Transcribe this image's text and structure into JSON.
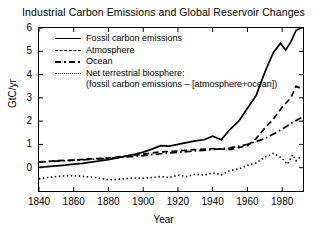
{
  "chart_data": {
    "type": "line",
    "title": "Industrial Carbon Emissions and Global Reservoir Changes",
    "xlabel": "Year",
    "ylabel": "GtC/yr",
    "xlim": [
      1840,
      1992
    ],
    "ylim": [
      -1.0,
      6.0
    ],
    "xticks": [
      1840,
      1860,
      1880,
      1900,
      1920,
      1940,
      1960,
      1980
    ],
    "yticks": [
      0,
      1,
      2,
      3,
      4,
      5,
      6
    ],
    "grid": false,
    "legend_position": "upper left",
    "series": [
      {
        "name": "Fossil carbon emissions",
        "style": "solid",
        "x": [
          1840,
          1845,
          1850,
          1855,
          1860,
          1865,
          1870,
          1875,
          1880,
          1885,
          1890,
          1895,
          1900,
          1905,
          1910,
          1915,
          1920,
          1925,
          1930,
          1935,
          1940,
          1945,
          1950,
          1955,
          1960,
          1965,
          1970,
          1975,
          1979,
          1982,
          1985,
          1988,
          1991
        ],
        "values": [
          0.02,
          0.05,
          0.08,
          0.11,
          0.15,
          0.19,
          0.24,
          0.29,
          0.35,
          0.42,
          0.5,
          0.58,
          0.67,
          0.8,
          0.95,
          0.93,
          1.0,
          1.08,
          1.15,
          1.2,
          1.35,
          1.2,
          1.65,
          2.0,
          2.55,
          3.1,
          4.1,
          4.95,
          5.35,
          5.05,
          5.4,
          5.9,
          6.0
        ]
      },
      {
        "name": "Atmosphere",
        "style": "dashed",
        "x": [
          1840,
          1850,
          1860,
          1870,
          1880,
          1890,
          1900,
          1910,
          1920,
          1930,
          1940,
          1950,
          1960,
          1965,
          1970,
          1975,
          1980,
          1985,
          1988,
          1991
        ],
        "values": [
          0.25,
          0.3,
          0.33,
          0.38,
          0.42,
          0.5,
          0.58,
          0.68,
          0.72,
          0.78,
          0.82,
          0.78,
          0.95,
          1.25,
          1.7,
          2.1,
          2.6,
          3.0,
          3.5,
          3.4
        ]
      },
      {
        "name": "Ocean",
        "style": "dashdot",
        "x": [
          1840,
          1850,
          1860,
          1870,
          1880,
          1890,
          1900,
          1910,
          1920,
          1930,
          1940,
          1950,
          1960,
          1970,
          1980,
          1985,
          1991
        ],
        "values": [
          0.24,
          0.28,
          0.32,
          0.36,
          0.4,
          0.46,
          0.52,
          0.6,
          0.66,
          0.72,
          0.78,
          0.85,
          1.0,
          1.25,
          1.65,
          1.9,
          2.15
        ]
      },
      {
        "name": "Net terrestrial biosphere:",
        "name_line2": "(fossil carbon emissions – [atmosphere+ocean])",
        "style": "dotted",
        "x": [
          1840,
          1845,
          1850,
          1855,
          1860,
          1865,
          1870,
          1875,
          1880,
          1885,
          1890,
          1895,
          1900,
          1905,
          1910,
          1915,
          1920,
          1925,
          1930,
          1935,
          1940,
          1945,
          1950,
          1955,
          1960,
          1965,
          1970,
          1975,
          1980,
          1983,
          1986,
          1988,
          1991
        ],
        "values": [
          -0.47,
          -0.42,
          -0.38,
          -0.35,
          -0.34,
          -0.37,
          -0.4,
          -0.45,
          -0.52,
          -0.5,
          -0.47,
          -0.44,
          -0.45,
          -0.42,
          -0.38,
          -0.42,
          -0.32,
          -0.38,
          -0.28,
          -0.32,
          -0.22,
          -0.3,
          -0.12,
          -0.05,
          0.1,
          0.2,
          0.45,
          0.62,
          0.4,
          0.15,
          0.55,
          0.3,
          0.5
        ]
      }
    ]
  },
  "legend": {
    "items": [
      {
        "label": "Fossil carbon emissions"
      },
      {
        "label": "Atmosphere"
      },
      {
        "label": "Ocean"
      },
      {
        "label": "Net terrestrial biosphere:",
        "continuation": "(fossil carbon emissions – [atmosphere+ocean])"
      }
    ]
  },
  "axes": {
    "y_tick_labels": [
      "6",
      "5",
      "4",
      "3",
      "2",
      "1",
      "0"
    ],
    "x_tick_labels": [
      "1840",
      "1860",
      "1880",
      "1900",
      "1920",
      "1940",
      "1960",
      "1980"
    ]
  }
}
